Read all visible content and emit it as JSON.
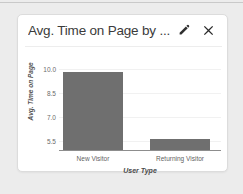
{
  "card": {
    "title": "Avg. Time on Page by ...",
    "edit_icon": "pencil-icon",
    "close_icon": "close-icon"
  },
  "colors": {
    "bar": "#6f6f6f",
    "card_background": "#ffffff",
    "page_background": "#ececec",
    "axis": "#8d8d8d",
    "gridline": "#f1f1f1"
  },
  "chart_data": {
    "type": "bar",
    "title": "Avg. Time on Page by ...",
    "categories": [
      "New Visitor",
      "Returning Visitor"
    ],
    "values": [
      9.8,
      5.65
    ],
    "xlabel": "User Type",
    "ylabel": "Avg. Time on Page",
    "ylim": [
      5.2,
      10.3
    ],
    "yticks": [
      10.0,
      8.5,
      7.0,
      5.5
    ],
    "ytick_labels": [
      "10.0",
      "8.5",
      "7.0",
      "5.5"
    ],
    "grid": true,
    "legend": null
  }
}
